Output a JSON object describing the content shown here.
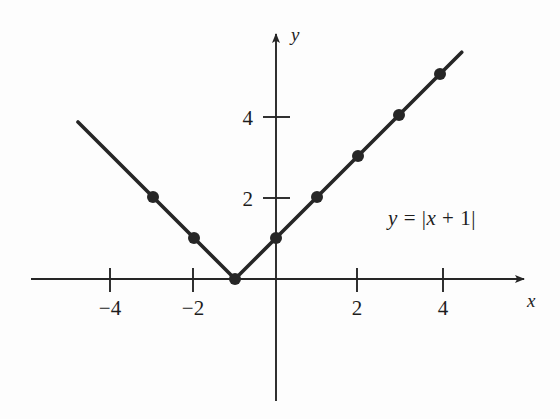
{
  "figure": {
    "background_color": "#fdfdfd",
    "ink_color": "#262626",
    "width": 560,
    "height": 419
  },
  "axes": {
    "x_axis_label": "x",
    "y_axis_label": "y",
    "origin_px": {
      "x": 276,
      "y": 279
    },
    "unit_px": 41,
    "x_ticks": [
      {
        "value": -4,
        "label": "−4",
        "px": 110
      },
      {
        "value": -2,
        "label": "−2",
        "px": 193
      },
      {
        "value": 2,
        "label": "2",
        "px": 357
      },
      {
        "value": 4,
        "label": "4",
        "px": 443
      }
    ],
    "y_ticks": [
      {
        "value": 2,
        "label": "2",
        "px": 198
      },
      {
        "value": 4,
        "label": "4",
        "px": 117
      }
    ]
  },
  "annotations": {
    "equation": {
      "text": "y = |x + 1|",
      "y_var": "y",
      "equals": "=",
      "bar_open": "|",
      "x_var": "x",
      "plus_one": "+ 1",
      "bar_close": "|",
      "position_px": {
        "x": 432,
        "y": 218
      }
    }
  },
  "chart_data": {
    "type": "line",
    "title": "",
    "subtitle": "",
    "xlabel": "x",
    "ylabel": "y",
    "function": "y = |x + 1|",
    "xlim": [
      -5.95,
      6.2
    ],
    "ylim": [
      -2.9,
      6.1
    ],
    "grid": false,
    "legend": "none",
    "annotations": [
      "y = |x + 1|"
    ],
    "x_tick_labels": [
      "−4",
      "−2",
      "2",
      "4"
    ],
    "x_tick_values": [
      -4,
      -2,
      2,
      4
    ],
    "y_tick_labels": [
      "2",
      "4"
    ],
    "y_tick_values": [
      2,
      4
    ],
    "series": [
      {
        "name": "y = |x + 1|",
        "line_x": [
          -4.83,
          -1,
          4.53
        ],
        "line_y": [
          3.83,
          0,
          5.53
        ],
        "marker_points": [
          {
            "x": -3,
            "y": 2
          },
          {
            "x": -2,
            "y": 1
          },
          {
            "x": -1,
            "y": 0
          },
          {
            "x": 0,
            "y": 1
          },
          {
            "x": 1,
            "y": 2
          },
          {
            "x": 2,
            "y": 3
          },
          {
            "x": 3,
            "y": 4
          },
          {
            "x": 4,
            "y": 5
          }
        ],
        "color": "#262626",
        "line_width": 3.6,
        "marker": "circle",
        "marker_size": 6
      }
    ]
  }
}
